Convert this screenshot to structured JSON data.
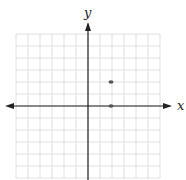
{
  "chart_data": {
    "type": "scatter",
    "title": "",
    "xlabel": "x",
    "ylabel": "y",
    "xlim": [
      -6,
      6
    ],
    "ylim": [
      -6,
      6
    ],
    "grid": true,
    "points": [
      {
        "x": 2,
        "y": 2
      },
      {
        "x": 2,
        "y": 0
      }
    ],
    "colors": {
      "grid": "#d8d8d8",
      "axis": "#222222",
      "point": "#555555"
    }
  }
}
